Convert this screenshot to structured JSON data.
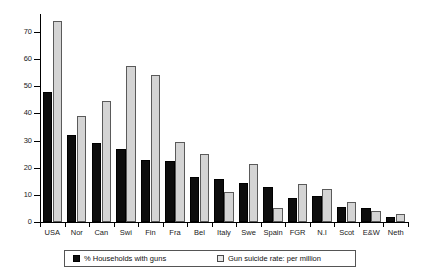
{
  "chart_data": {
    "type": "bar",
    "title": "",
    "xlabel": "",
    "ylabel": "",
    "ylim": [
      0,
      75
    ],
    "grid": false,
    "legend_position": "bottom",
    "categories": [
      "USA",
      "Nor",
      "Can",
      "Swi",
      "Fin",
      "Fra",
      "Bel",
      "Italy",
      "Swe",
      "Spain",
      "FGR",
      "N.I",
      "Scot",
      "E&W",
      "Neth"
    ],
    "ytick_labels": [
      "0",
      "10",
      "20",
      "30",
      "40",
      "50",
      "60",
      "70"
    ],
    "yticks": [
      0,
      10,
      20,
      30,
      40,
      50,
      60,
      70
    ],
    "series": [
      {
        "name": "% Households with guns",
        "color": "#0d0d0d",
        "values": [
          48,
          32,
          29,
          27,
          23,
          22.5,
          16.5,
          16,
          14.5,
          13,
          9,
          9.5,
          5.5,
          5,
          2
        ]
      },
      {
        "name": "Gun suicide rate: per million",
        "color": "#d4d4d4",
        "values": [
          74,
          39,
          44.5,
          57.5,
          54,
          29.5,
          25,
          11,
          21.5,
          5,
          14,
          12,
          7.5,
          4,
          3
        ]
      }
    ]
  },
  "legend": {
    "items": [
      {
        "label": "% Households with guns",
        "swatch": "black"
      },
      {
        "label": "Gun suicide rate: per million",
        "swatch": "gray"
      }
    ]
  },
  "icons": {
    "black_swatch": "filled-square-icon",
    "gray_swatch": "outlined-square-icon"
  }
}
